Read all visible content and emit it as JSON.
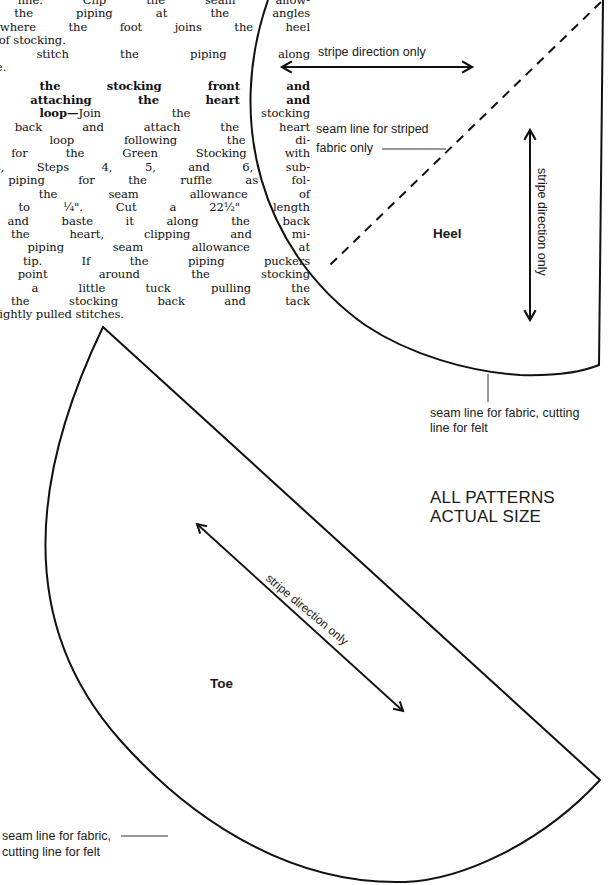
{
  "instructions": {
    "lines_step_a": [
      "am line. Clip the seam allow-",
      "of the piping at the angles",
      "d where the foot joins the heel",
      "g part of stocking."
    ],
    "lines_step_b": [
      "hine stitch the piping along",
      "am line."
    ],
    "step_c_heading_lines": [
      "ining the stocking front and",
      "and attaching the heart and"
    ],
    "step_c_heading_tail": "n loop—",
    "step_c_first_text": "Join the stocking",
    "lines_step_c": [
      "nd back and attach the heart",
      "anging loop following the di-",
      "ns for the Green Stocking with",
      " Ruffles, Steps 4, 5, and 6, sub-",
      "ng piping for the ruffle as fol-",
      "Trim the seam allowance of",
      "ping to ¼\". Cut a 22½\" length",
      "ng and baste it along the back",
      "of the heart, clipping and mi-",
      " the piping seam allowance at",
      "eart tip. If the piping puckers",
      "y point around the stocking",
      " make a little tuck pulling the",
      " to the stocking back and tack",
      " a few tightly pulled stitches."
    ]
  },
  "heel_pattern": {
    "title": "Heel",
    "stripe_label_horizontal": "stripe direction only",
    "stripe_label_vertical": "stripe direction only",
    "seam_striped_label_line1": "seam line for striped",
    "seam_striped_label_line2": "fabric only",
    "seam_fabric_label_line1": "seam line for fabric, cutting",
    "seam_fabric_label_line2": "line for felt"
  },
  "toe_pattern": {
    "title": "Toe",
    "stripe_label_diagonal": "stripe direction only",
    "seam_fabric_label_line1": "seam line for fabric,",
    "seam_fabric_label_line2": "cutting line for felt"
  },
  "note": {
    "line1": "ALL PATTERNS",
    "line2": "ACTUAL SIZE"
  },
  "colors": {
    "ink": "#111111",
    "paper": "#ffffff"
  }
}
